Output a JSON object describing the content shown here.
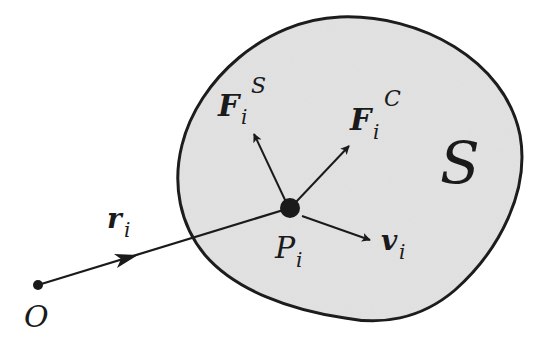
{
  "diagram": {
    "type": "rigid body / particle system free-body sketch",
    "colors": {
      "background": "#ffffff",
      "region_fill": "#e2e2e2",
      "stroke": "#1a1a1a"
    },
    "region": {
      "label": "S"
    },
    "origin": {
      "label": "O"
    },
    "point": {
      "label": "P",
      "subscript": "i"
    },
    "vectors": {
      "position": {
        "label": "r",
        "subscript": "i"
      },
      "surface_force": {
        "label": "F",
        "subscript": "i",
        "superscript": "S"
      },
      "contact_force": {
        "label": "F",
        "subscript": "i",
        "superscript": "C"
      },
      "velocity": {
        "label": "v",
        "subscript": "i"
      }
    }
  }
}
